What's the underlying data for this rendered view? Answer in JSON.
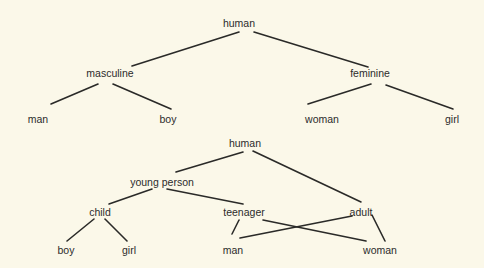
{
  "diagram": {
    "type": "tree-comparison",
    "background": "#fbf8e9",
    "line_color": "#2a2a28",
    "trees": [
      {
        "name": "hierarchy-by-gender",
        "nodes": [
          {
            "id": "t1-human",
            "label": "human",
            "x": 239,
            "y": 23
          },
          {
            "id": "t1-masculine",
            "label": "masculine",
            "x": 110,
            "y": 73
          },
          {
            "id": "t1-feminine",
            "label": "feminine",
            "x": 370,
            "y": 73
          },
          {
            "id": "t1-man",
            "label": "man",
            "x": 38,
            "y": 119
          },
          {
            "id": "t1-boy",
            "label": "boy",
            "x": 168,
            "y": 119
          },
          {
            "id": "t1-woman",
            "label": "woman",
            "x": 322,
            "y": 119
          },
          {
            "id": "t1-girl",
            "label": "girl",
            "x": 452,
            "y": 119
          }
        ],
        "edges": [
          {
            "from": "t1-human",
            "to": "t1-masculine",
            "x1": 239,
            "y1": 32,
            "x2": 132,
            "y2": 66
          },
          {
            "from": "t1-human",
            "to": "t1-feminine",
            "x1": 254,
            "y1": 32,
            "x2": 368,
            "y2": 67
          },
          {
            "from": "t1-masculine",
            "to": "t1-man",
            "x1": 98,
            "y1": 84,
            "x2": 51,
            "y2": 104
          },
          {
            "from": "t1-masculine",
            "to": "t1-boy",
            "x1": 113,
            "y1": 84,
            "x2": 171,
            "y2": 109
          },
          {
            "from": "t1-feminine",
            "to": "t1-woman",
            "x1": 371,
            "y1": 84,
            "x2": 308,
            "y2": 104
          },
          {
            "from": "t1-feminine",
            "to": "t1-girl",
            "x1": 386,
            "y1": 85,
            "x2": 453,
            "y2": 109
          }
        ]
      },
      {
        "name": "hierarchy-by-age",
        "nodes": [
          {
            "id": "t2-human",
            "label": "human",
            "x": 245,
            "y": 143
          },
          {
            "id": "t2-young-person",
            "label": "young person",
            "x": 162,
            "y": 182
          },
          {
            "id": "t2-child",
            "label": "child",
            "x": 100,
            "y": 212
          },
          {
            "id": "t2-teenager",
            "label": "teenager",
            "x": 244,
            "y": 212
          },
          {
            "id": "t2-adult",
            "label": "adult",
            "x": 361,
            "y": 212
          },
          {
            "id": "t2-boy",
            "label": "boy",
            "x": 66,
            "y": 250
          },
          {
            "id": "t2-girl",
            "label": "girl",
            "x": 129,
            "y": 250
          },
          {
            "id": "t2-man",
            "label": "man",
            "x": 233,
            "y": 250
          },
          {
            "id": "t2-woman",
            "label": "woman",
            "x": 380,
            "y": 250
          }
        ],
        "edges": [
          {
            "from": "t2-human",
            "to": "t2-young-person",
            "x1": 243,
            "y1": 152,
            "x2": 176,
            "y2": 172
          },
          {
            "from": "t2-human",
            "to": "t2-adult",
            "x1": 253,
            "y1": 151,
            "x2": 361,
            "y2": 202
          },
          {
            "from": "t2-young-person",
            "to": "t2-child",
            "x1": 152,
            "y1": 189,
            "x2": 109,
            "y2": 204
          },
          {
            "from": "t2-young-person",
            "to": "t2-teenager",
            "x1": 167,
            "y1": 189,
            "x2": 243,
            "y2": 204
          },
          {
            "from": "t2-child",
            "to": "t2-boy",
            "x1": 94,
            "y1": 219,
            "x2": 67,
            "y2": 241
          },
          {
            "from": "t2-child",
            "to": "t2-girl",
            "x1": 105,
            "y1": 219,
            "x2": 127,
            "y2": 241
          },
          {
            "from": "t2-teenager",
            "to": "t2-man",
            "x1": 239,
            "y1": 220,
            "x2": 232,
            "y2": 234
          },
          {
            "from": "t2-teenager",
            "to": "t2-woman",
            "x1": 263,
            "y1": 220,
            "x2": 366,
            "y2": 241
          },
          {
            "from": "t2-adult",
            "to": "t2-man",
            "x1": 352,
            "y1": 216,
            "x2": 240,
            "y2": 238
          },
          {
            "from": "t2-adult",
            "to": "t2-woman",
            "x1": 372,
            "y1": 215,
            "x2": 385,
            "y2": 241
          }
        ]
      }
    ]
  }
}
